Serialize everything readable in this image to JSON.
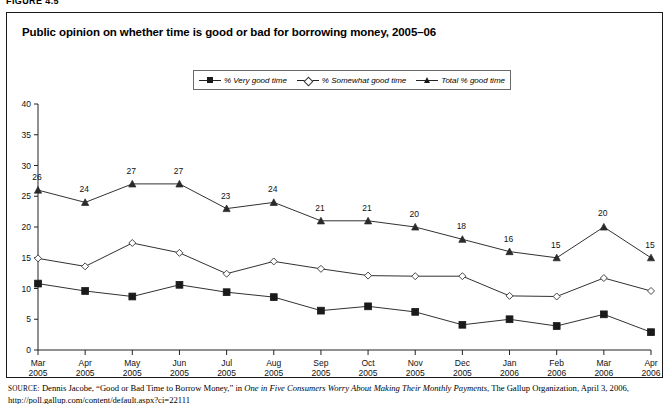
{
  "figure": {
    "label": "FIGURE 4.5",
    "title": "Public opinion on whether time is good or bad for borrowing money, 2005–06"
  },
  "legend": {
    "items": [
      {
        "marker": "filled-square",
        "label": "% Very good time"
      },
      {
        "marker": "open-diamond",
        "label": "% Somewhat good time"
      },
      {
        "marker": "filled-triangle",
        "label": "Total % good time"
      }
    ]
  },
  "source": {
    "prefix": "SOURCE:",
    "text_a": " Dennis Jacobe, “Good or Bad Time to Borrow Money,” in ",
    "italic": "One in Five Consumers Worry About Making Their Monthly Payments",
    "text_b": ", The Gallup",
    "line2": "Organization, April 3, 2006, http://poll.gallup.com/content/default.aspx?ci=22111"
  },
  "chart_data": {
    "type": "line",
    "title": "Public opinion on whether time is good or bad for borrowing money, 2005–06",
    "xlabel": "",
    "ylabel": "",
    "ylim": [
      0,
      40
    ],
    "yticks": [
      0,
      5,
      10,
      15,
      20,
      25,
      30,
      35,
      40
    ],
    "grid": false,
    "legend_position": "top-center",
    "categories": [
      "Mar 2005",
      "Apr 2005",
      "May 2005",
      "Jun 2005",
      "Jul 2005",
      "Aug 2005",
      "Sep 2005",
      "Oct 2005",
      "Nov 2005",
      "Dec 2005",
      "Jan 2006",
      "Feb 2006",
      "Mar 2006",
      "Apr 2006"
    ],
    "x_tick_lines": [
      [
        "Mar",
        "2005"
      ],
      [
        "Apr",
        "2005"
      ],
      [
        "May",
        "2005"
      ],
      [
        "Jun",
        "2005"
      ],
      [
        "Jul",
        "2005"
      ],
      [
        "Aug",
        "2005"
      ],
      [
        "Sep",
        "2005"
      ],
      [
        "Oct",
        "2005"
      ],
      [
        "Nov",
        "2005"
      ],
      [
        "Dec",
        "2005"
      ],
      [
        "Jan",
        "2006"
      ],
      [
        "Feb",
        "2006"
      ],
      [
        "Mar",
        "2006"
      ],
      [
        "Apr",
        "2006"
      ]
    ],
    "series": [
      {
        "name": "% Very good time",
        "marker": "filled-square",
        "labels_shown": false,
        "values": [
          10.8,
          9.6,
          8.7,
          10.6,
          9.4,
          8.6,
          6.4,
          7.1,
          6.2,
          4.1,
          5.0,
          3.9,
          5.8,
          2.9
        ]
      },
      {
        "name": "% Somewhat good time",
        "marker": "open-diamond",
        "labels_shown": false,
        "values": [
          14.9,
          13.6,
          17.4,
          15.8,
          12.4,
          14.4,
          13.2,
          12.1,
          12.0,
          12.0,
          8.8,
          8.7,
          11.7,
          9.6
        ]
      },
      {
        "name": "Total % good time",
        "marker": "filled-triangle",
        "labels_shown": true,
        "values": [
          26,
          24,
          27,
          27,
          23,
          24,
          21,
          21,
          20,
          18,
          16,
          15,
          20,
          15
        ]
      }
    ]
  }
}
